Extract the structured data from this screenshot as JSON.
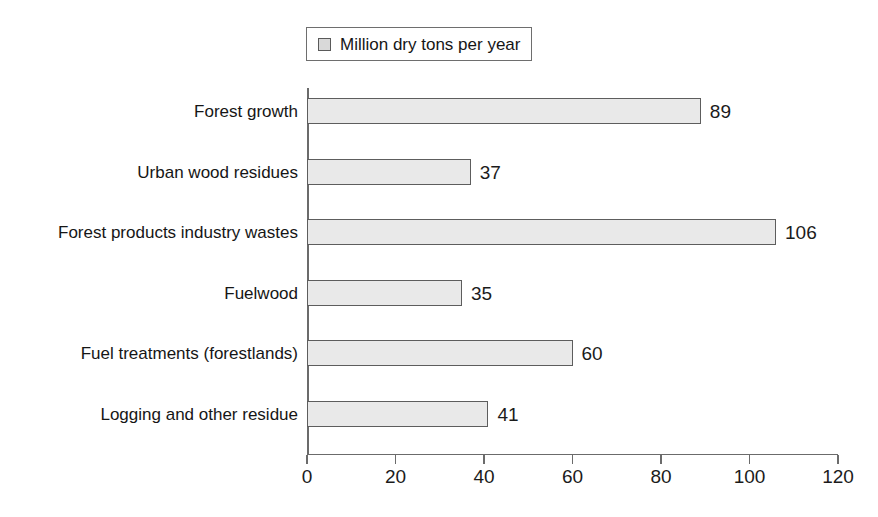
{
  "chart_data": {
    "type": "bar",
    "orientation": "horizontal",
    "title": "",
    "xlabel": "",
    "ylabel": "",
    "xlim": [
      0,
      120
    ],
    "xticks": [
      0,
      20,
      40,
      60,
      80,
      100,
      120
    ],
    "grid": false,
    "legend": {
      "position": "top",
      "entries": [
        {
          "label": "Million dry tons per year",
          "swatch_color": "#d9d9d9"
        }
      ]
    },
    "series_name": "Million dry tons per year",
    "categories": [
      "Forest growth",
      "Urban wood residues",
      "Forest products industry wastes",
      "Fuelwood",
      "Fuel treatments (forestlands)",
      "Logging and other residue"
    ],
    "values": [
      89,
      37,
      106,
      35,
      60,
      41
    ],
    "value_labels": [
      "89",
      "37",
      "106",
      "35",
      "60",
      "41"
    ],
    "colors": {
      "bar_fill": "#e9e9e9",
      "bar_border": "#5d5d5d",
      "axis": "#6b6b6b",
      "text": "#1b1b1b",
      "background": "#ffffff"
    }
  }
}
